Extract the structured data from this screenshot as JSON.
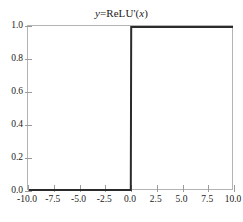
{
  "chart_data": {
    "type": "line",
    "title": "y=ReLU'(x)",
    "title_parts": {
      "var_y": "y",
      "equals_fn": "=ReLU'(",
      "var_x": "x",
      "close": ")"
    },
    "xlabel": "",
    "ylabel": "",
    "xlim": [
      -10.0,
      10.0
    ],
    "ylim": [
      0.0,
      1.0
    ],
    "grid": false,
    "legend": false,
    "xticks": [
      "-10.0",
      "-7.5",
      "-5.0",
      "-2.5",
      "0.0",
      "2.5",
      "5.0",
      "7.5",
      "10.0"
    ],
    "xtick_values": [
      -10.0,
      -7.5,
      -5.0,
      -2.5,
      0.0,
      2.5,
      5.0,
      7.5,
      10.0
    ],
    "yticks": [
      "0.0",
      "0.2",
      "0.4",
      "0.6",
      "0.8",
      "1.0"
    ],
    "ytick_values": [
      0.0,
      0.2,
      0.4,
      0.6,
      0.8,
      1.0
    ],
    "series": [
      {
        "name": "ReLU derivative",
        "color": "#2b2b2b",
        "line_width": 2,
        "x": [
          -10.0,
          -0.02,
          0.0,
          0.02,
          10.0
        ],
        "y": [
          0.0,
          0.0,
          0.5,
          1.0,
          1.0
        ]
      }
    ],
    "annotations": [],
    "colors": {
      "line": "#2b2b2b",
      "frame": "#b4b4b4",
      "tick": "#9a9a9a",
      "text": "#1a1a1a",
      "background": "#ffffff"
    }
  }
}
